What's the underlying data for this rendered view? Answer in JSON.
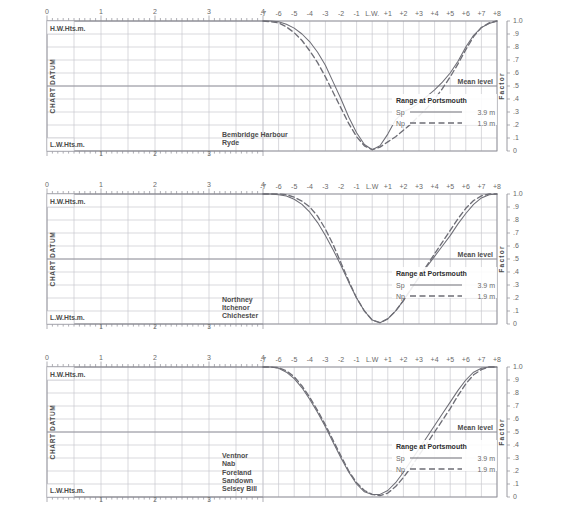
{
  "page": {
    "grid_color": "#c9c9cf",
    "frame_color": "#8e8e96",
    "curve_color": "#6e6e76",
    "text_color": "#4c4c4c"
  },
  "axes": {
    "hw_label": "H.W.Hts.m.",
    "lw_label": "L.W.Hts.m.",
    "datum_label": "CHART DATUM",
    "factor_label": "Factor",
    "mean_level_label": "Mean level",
    "height_ticks_top": [
      "0",
      "1",
      "2",
      "3",
      "4"
    ],
    "height_ticks_bottom": [
      "1",
      "2",
      "3"
    ],
    "hour_ticks": [
      "-7",
      "-6",
      "-5",
      "-4",
      "-3",
      "-2",
      "-1",
      "L.W.",
      "+1",
      "+2",
      "+3",
      "+4",
      "+5",
      "+6",
      "+7",
      "+8"
    ],
    "hour_ticks_alt": [
      "-7",
      "-6",
      "-5",
      "-4",
      "-3",
      "-2",
      "-1",
      "L.W",
      "+1",
      "+2",
      "+3",
      "+4",
      "+5",
      "+6",
      "+7",
      "+8"
    ],
    "factor_ticks": [
      "1.0",
      ".9",
      ".8",
      ".7",
      ".6",
      ".5",
      ".4",
      ".3",
      ".2",
      ".1",
      "0"
    ]
  },
  "legend": {
    "title": "Range at Portsmouth",
    "springs_label": "Sp",
    "springs_value": "3.9 m",
    "neaps_label": "Np",
    "neaps_value": "1.9 m"
  },
  "chart_data": [
    {
      "type": "line",
      "title": "",
      "xlabel": "Hours relative to L.W.",
      "ylabel": "Factor",
      "places": [
        "Bembridge Harbour",
        "Ryde"
      ],
      "xlim": [
        -7,
        8
      ],
      "ylim": [
        0,
        1
      ],
      "grid": true,
      "legend_position": "right-inside",
      "series": [
        {
          "name": "Sp",
          "style": "solid",
          "x": [
            -7,
            -6.5,
            -6,
            -5.5,
            -5,
            -4.5,
            -4,
            -3.5,
            -3,
            -2.5,
            -2,
            -1.5,
            -1,
            -0.5,
            0,
            0.5,
            1,
            1.5,
            2,
            2.5,
            3,
            3.5,
            4,
            4.5,
            5,
            5.5,
            6,
            6.5,
            7,
            7.5,
            8
          ],
          "y": [
            1.0,
            1.0,
            0.995,
            0.975,
            0.945,
            0.9,
            0.84,
            0.76,
            0.66,
            0.53,
            0.4,
            0.26,
            0.14,
            0.05,
            0.01,
            0.04,
            0.13,
            0.24,
            0.3,
            0.33,
            0.37,
            0.42,
            0.47,
            0.53,
            0.6,
            0.69,
            0.8,
            0.89,
            0.95,
            0.98,
            1.0
          ]
        },
        {
          "name": "Np",
          "style": "dashed",
          "x": [
            -7,
            -6.5,
            -6,
            -5.5,
            -5,
            -4.5,
            -4,
            -3.5,
            -3,
            -2.5,
            -2,
            -1.5,
            -1,
            -0.5,
            0,
            0.5,
            1,
            1.5,
            2,
            2.5,
            3,
            3.5,
            4,
            4.5,
            5,
            5.5,
            6,
            6.5,
            7,
            7.5,
            8
          ],
          "y": [
            1.0,
            0.995,
            0.985,
            0.955,
            0.91,
            0.85,
            0.77,
            0.68,
            0.57,
            0.45,
            0.33,
            0.21,
            0.11,
            0.04,
            0.01,
            0.03,
            0.07,
            0.11,
            0.16,
            0.21,
            0.27,
            0.33,
            0.4,
            0.48,
            0.57,
            0.67,
            0.78,
            0.88,
            0.95,
            0.985,
            1.0
          ]
        }
      ]
    },
    {
      "type": "line",
      "title": "",
      "xlabel": "Hours relative to L.W.",
      "ylabel": "Factor",
      "places": [
        "Northney",
        "Itchenor",
        "Chichester"
      ],
      "xlim": [
        -7,
        8
      ],
      "ylim": [
        0,
        1
      ],
      "grid": true,
      "legend_position": "right-inside",
      "series": [
        {
          "name": "Sp",
          "style": "solid",
          "x": [
            -7,
            -6.5,
            -6,
            -5.5,
            -5,
            -4.5,
            -4,
            -3.5,
            -3,
            -2.5,
            -2,
            -1.5,
            -1,
            -0.5,
            0,
            0.5,
            1,
            1.5,
            2,
            2.5,
            3,
            3.5,
            4,
            4.5,
            5,
            5.5,
            6,
            6.5,
            7,
            7.5,
            8
          ],
          "y": [
            1.0,
            1.0,
            0.995,
            0.985,
            0.96,
            0.92,
            0.86,
            0.78,
            0.68,
            0.57,
            0.45,
            0.32,
            0.2,
            0.1,
            0.03,
            0.01,
            0.04,
            0.1,
            0.18,
            0.27,
            0.36,
            0.44,
            0.52,
            0.6,
            0.68,
            0.77,
            0.85,
            0.92,
            0.97,
            0.995,
            1.0
          ]
        },
        {
          "name": "Np",
          "style": "dashed",
          "x": [
            -7,
            -6.5,
            -6,
            -5.5,
            -5,
            -4.5,
            -4,
            -3.5,
            -3,
            -2.5,
            -2,
            -1.5,
            -1,
            -0.5,
            0,
            0.5,
            1,
            1.5,
            2,
            2.5,
            3,
            3.5,
            4,
            4.5,
            5,
            5.5,
            6,
            6.5,
            7,
            7.5,
            8
          ],
          "y": [
            1.0,
            1.0,
            1.0,
            0.995,
            0.975,
            0.945,
            0.9,
            0.83,
            0.73,
            0.61,
            0.47,
            0.33,
            0.2,
            0.1,
            0.03,
            0.01,
            0.04,
            0.1,
            0.18,
            0.27,
            0.36,
            0.45,
            0.54,
            0.63,
            0.72,
            0.81,
            0.89,
            0.95,
            0.985,
            1.0,
            1.0
          ]
        }
      ]
    },
    {
      "type": "line",
      "title": "",
      "xlabel": "Hours relative to L.W.",
      "ylabel": "Factor",
      "places": [
        "Ventnor",
        "Nab",
        "Foreland",
        "Sandown",
        "Selsey Bill"
      ],
      "xlim": [
        -7,
        8
      ],
      "ylim": [
        0,
        1
      ],
      "grid": true,
      "legend_position": "right-inside",
      "series": [
        {
          "name": "Sp",
          "style": "solid",
          "x": [
            -7,
            -6.5,
            -6,
            -5.5,
            -5,
            -4.5,
            -4,
            -3.5,
            -3,
            -2.5,
            -2,
            -1.5,
            -1,
            -0.5,
            0,
            0.5,
            1,
            1.5,
            2,
            2.5,
            3,
            3.5,
            4,
            4.5,
            5,
            5.5,
            6,
            6.5,
            7,
            7.5,
            8
          ],
          "y": [
            1.0,
            1.0,
            0.99,
            0.96,
            0.91,
            0.84,
            0.75,
            0.65,
            0.54,
            0.42,
            0.3,
            0.19,
            0.1,
            0.04,
            0.02,
            0.02,
            0.05,
            0.11,
            0.19,
            0.28,
            0.37,
            0.46,
            0.55,
            0.64,
            0.73,
            0.82,
            0.9,
            0.96,
            0.99,
            1.0,
            1.0
          ]
        },
        {
          "name": "Np",
          "style": "dashed",
          "x": [
            -7,
            -6.5,
            -6,
            -5.5,
            -5,
            -4.5,
            -4,
            -3.5,
            -3,
            -2.5,
            -2,
            -1.5,
            -1,
            -0.5,
            0,
            0.5,
            1,
            1.5,
            2,
            2.5,
            3,
            3.5,
            4,
            4.5,
            5,
            5.5,
            6,
            6.5,
            7,
            7.5,
            8
          ],
          "y": [
            1.0,
            1.0,
            0.995,
            0.97,
            0.925,
            0.855,
            0.765,
            0.665,
            0.555,
            0.435,
            0.315,
            0.2,
            0.11,
            0.05,
            0.02,
            0.01,
            0.03,
            0.08,
            0.15,
            0.23,
            0.32,
            0.41,
            0.5,
            0.59,
            0.68,
            0.78,
            0.87,
            0.94,
            0.98,
            1.0,
            1.0
          ]
        }
      ]
    }
  ]
}
